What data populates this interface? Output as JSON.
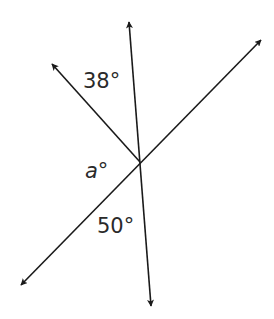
{
  "diagram": {
    "type": "intersecting-lines-angle-problem",
    "intersection_point": {
      "x": 140,
      "y": 162
    },
    "lines": [
      {
        "name": "near-vertical-line",
        "from": {
          "x": 151,
          "y": 306
        },
        "to": {
          "x": 129,
          "y": 22
        },
        "arrows": "both"
      },
      {
        "name": "diagonal-line",
        "from": {
          "x": 21,
          "y": 285
        },
        "to": {
          "x": 261,
          "y": 40
        },
        "arrows": "both"
      }
    ],
    "rays": [
      {
        "name": "upper-left-ray",
        "from": {
          "x": 140,
          "y": 162
        },
        "to": {
          "x": 52,
          "y": 64
        },
        "arrows": "end"
      }
    ],
    "labels": {
      "angle_top": "38°",
      "angle_unknown": "a°",
      "angle_bottom": "50°"
    },
    "colors": {
      "stroke": "#1a1a1a",
      "text": "#2a2a2a",
      "background": "#ffffff"
    }
  }
}
